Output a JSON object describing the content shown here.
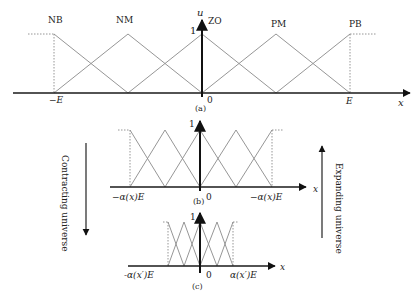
{
  "figure": {
    "panel_a": {
      "caption": "(a)",
      "set_labels": [
        "NB",
        "NM",
        "ZO",
        "PM",
        "PB"
      ],
      "y_axis_label": "u",
      "y_tick": "1",
      "x_axis_label": "x",
      "x_ticks": [
        "−E",
        "0",
        "E"
      ]
    },
    "panel_b": {
      "caption": "(b)",
      "y_tick": "1",
      "x_axis_label": "x",
      "x_ticks": [
        "−α(x)E",
        "0",
        "−α(x)E"
      ]
    },
    "panel_c": {
      "caption": "(c)",
      "y_tick": "1",
      "x_axis_label": "x",
      "x_ticks": [
        "-α(x′)E",
        "0",
        "α(x′)E"
      ]
    },
    "left_arrow_label": "Contracting universe",
    "right_arrow_label": "Expanding universe"
  }
}
